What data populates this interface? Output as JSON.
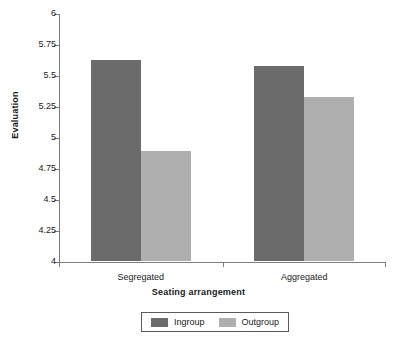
{
  "chart_data": {
    "type": "bar",
    "title": "",
    "xlabel": "Seating arrangement",
    "ylabel": "Evaluation",
    "categories": [
      "Segregated",
      "Aggregated"
    ],
    "series": [
      {
        "name": "Ingroup",
        "values": [
          5.62,
          5.57
        ],
        "color": "#6b6b6b"
      },
      {
        "name": "Outgroup",
        "values": [
          4.89,
          5.32
        ],
        "color": "#afafaf"
      }
    ],
    "ylim": [
      4,
      6
    ],
    "yticks": [
      4,
      4.25,
      4.5,
      4.75,
      5,
      5.25,
      5.5,
      5.75,
      6
    ],
    "ytick_labels": [
      "4",
      "4.25",
      "4.5",
      "4.75",
      "5",
      "5.25",
      "5.5",
      "5.75",
      "6"
    ],
    "grid": false,
    "legend_position": "bottom"
  },
  "axis": {
    "y_title": "Evaluation",
    "x_title": "Seating arrangement"
  },
  "legend": {
    "items": [
      {
        "label": "Ingroup",
        "color": "#6b6b6b"
      },
      {
        "label": "Outgroup",
        "color": "#afafaf"
      }
    ]
  }
}
